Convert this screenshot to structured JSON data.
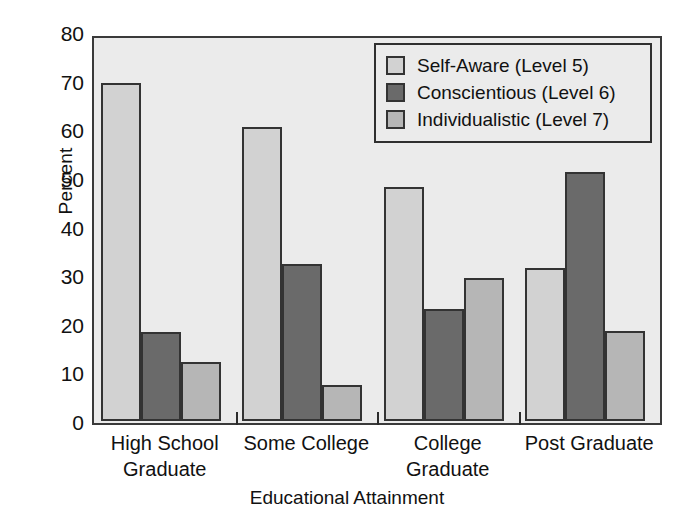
{
  "chart_data": {
    "type": "bar",
    "title": "",
    "xlabel": "Educational Attainment",
    "ylabel": "Percent",
    "categories": [
      "High School Graduate",
      "Some College",
      "College Graduate",
      "Post Graduate"
    ],
    "category_lines": [
      [
        "High School",
        "Graduate"
      ],
      [
        "Some College",
        ""
      ],
      [
        "College",
        "Graduate"
      ],
      [
        "Post Graduate",
        ""
      ]
    ],
    "series": [
      {
        "name": "Self-Aware (Level 5)",
        "color": "#d2d2d2",
        "values": [
          70.2,
          61.1,
          48.7,
          31.8
        ]
      },
      {
        "name": "Conscientious (Level 6)",
        "color": "#6a6a6a",
        "values": [
          18.5,
          32.6,
          23.2,
          51.8
        ]
      },
      {
        "name": "Individualistic (Level 7)",
        "color": "#b6b6b6",
        "values": [
          12.2,
          7.4,
          29.7,
          18.7
        ]
      }
    ],
    "ylim": [
      0,
      80
    ],
    "yticks": [
      0,
      10,
      20,
      30,
      40,
      50,
      60,
      70,
      80
    ],
    "ytick_labels": [
      "0",
      "10",
      "20",
      "30",
      "40",
      "50",
      "60",
      "70",
      "80"
    ],
    "grid": false,
    "legend_position": "top-right",
    "legend_entries": [
      "Self-Aware (Level 5)",
      "Conscientious (Level 6)",
      "Individualistic (Level 7)"
    ],
    "plot_background": "#ebebeb",
    "figure_background": "#ffffff"
  }
}
